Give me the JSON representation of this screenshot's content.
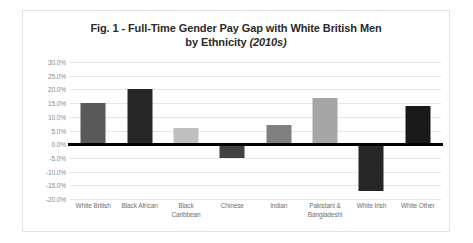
{
  "chart_data": {
    "type": "bar",
    "title_line1": "Fig. 1 - Full-Time Gender Pay Gap with White British Men",
    "title_line2_main": "by Ethnicity ",
    "title_line2_year": "(2010s)",
    "title": "Fig. 1 - Full-Time Gender Pay Gap with White British Men by Ethnicity (2010s)",
    "xlabel": "",
    "ylabel": "",
    "ylim": [
      -20,
      30
    ],
    "ytick_step": 5,
    "grid": true,
    "legend": "none",
    "categories": [
      "White British",
      "Black African",
      "Black Caribbean",
      "Chinese",
      "Indian",
      "Pakistani & Bangladeshi",
      "White Irish",
      "White Other"
    ],
    "category_lines": [
      [
        "White British"
      ],
      [
        "Black African"
      ],
      [
        "Black",
        "Caribbean"
      ],
      [
        "Chinese"
      ],
      [
        "Indian"
      ],
      [
        "Pakistani &",
        "Bangladeshi"
      ],
      [
        "White Irish"
      ],
      [
        "White Other"
      ]
    ],
    "values": [
      15.0,
      20.0,
      6.0,
      -5.0,
      7.0,
      17.0,
      -17.0,
      14.0
    ],
    "bar_colors": [
      "#595959",
      "#262626",
      "#bfbfbf",
      "#404040",
      "#808080",
      "#a6a6a6",
      "#262626",
      "#1a1a1a"
    ],
    "ytick_labels": [
      "30.0%",
      "25.0%",
      "20.0%",
      "15.0%",
      "10.0%",
      "5.0%",
      "0.0%",
      "-5.0%",
      "-10.0%",
      "-15.0%",
      "-20.0%"
    ],
    "ytick_values": [
      30,
      25,
      20,
      15,
      10,
      5,
      0,
      -5,
      -10,
      -15,
      -20
    ]
  },
  "colors": {
    "grid": "#e6e6e6",
    "zero_line": "#000000",
    "frame_border": "#e2e2e2",
    "tick_text": "#8a8a8a",
    "label_text": "#6f6f6f",
    "title_text": "#2b2b2b",
    "background": "#ffffff"
  }
}
